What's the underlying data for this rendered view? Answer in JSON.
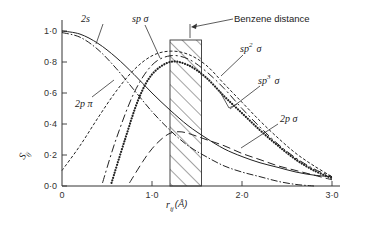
{
  "chart_data": {
    "type": "line",
    "title": "",
    "xlabel": "r_ij (Å)",
    "ylabel": "S_ij",
    "xlim": [
      0,
      3.3
    ],
    "ylim": [
      0,
      1.05
    ],
    "xticks": [
      "0",
      "1·0",
      "2·0",
      "3·0"
    ],
    "xtick_values": [
      0,
      1.0,
      2.0,
      3.0
    ],
    "yticks": [
      "0·0",
      "0·2",
      "0·4",
      "0·6",
      "0·8",
      "1·0"
    ],
    "ytick_values": [
      0,
      0.2,
      0.4,
      0.6,
      0.8,
      1.0
    ],
    "grid": false,
    "annotations": [
      {
        "text": "Benzene distance",
        "region_x": [
          1.2,
          1.55
        ]
      }
    ],
    "series": [
      {
        "name": "2s",
        "style": "solid",
        "x": [
          0,
          0.2,
          0.4,
          0.6,
          0.8,
          1.0,
          1.2,
          1.4,
          1.6,
          1.8,
          2.0,
          2.2,
          2.4,
          2.6,
          2.8,
          3.0
        ],
        "y": [
          1.0,
          0.98,
          0.92,
          0.83,
          0.72,
          0.6,
          0.49,
          0.39,
          0.31,
          0.24,
          0.19,
          0.15,
          0.12,
          0.09,
          0.07,
          0.06
        ]
      },
      {
        "name": "2p π",
        "style": "dashdot",
        "x": [
          0,
          0.2,
          0.4,
          0.6,
          0.8,
          1.0,
          1.2,
          1.4,
          1.6,
          1.8,
          2.0,
          2.2,
          2.4,
          2.6,
          2.8
        ],
        "y": [
          0.99,
          0.96,
          0.88,
          0.76,
          0.62,
          0.48,
          0.36,
          0.26,
          0.19,
          0.13,
          0.09,
          0.06,
          0.03,
          0.01,
          0.0
        ]
      },
      {
        "name": "sp σ",
        "style": "dashed-short",
        "x": [
          0,
          0.2,
          0.4,
          0.6,
          0.8,
          1.0,
          1.2,
          1.4,
          1.6,
          1.8,
          2.0,
          2.2,
          2.4,
          2.6,
          2.8,
          3.0
        ],
        "y": [
          0.1,
          0.26,
          0.44,
          0.61,
          0.75,
          0.84,
          0.87,
          0.85,
          0.78,
          0.66,
          0.54,
          0.42,
          0.31,
          0.21,
          0.13,
          0.06
        ]
      },
      {
        "name": "sp² σ",
        "style": "long-dash-dot",
        "x": [
          0.45,
          0.6,
          0.8,
          1.0,
          1.2,
          1.4,
          1.6,
          1.8,
          2.0,
          2.2,
          2.4,
          2.6,
          2.8,
          3.0
        ],
        "y": [
          0.02,
          0.3,
          0.6,
          0.78,
          0.84,
          0.82,
          0.74,
          0.63,
          0.5,
          0.38,
          0.27,
          0.18,
          0.11,
          0.06
        ]
      },
      {
        "name": "sp³ σ",
        "style": "dotted",
        "x": [
          0.55,
          0.7,
          0.85,
          1.0,
          1.2,
          1.4,
          1.6,
          1.8,
          2.0,
          2.2,
          2.4,
          2.6,
          2.8,
          3.0
        ],
        "y": [
          0.02,
          0.3,
          0.56,
          0.72,
          0.8,
          0.78,
          0.7,
          0.58,
          0.47,
          0.36,
          0.26,
          0.17,
          0.1,
          0.05
        ]
      },
      {
        "name": "2p σ",
        "style": "dashed-long",
        "x": [
          0.75,
          0.9,
          1.0,
          1.1,
          1.2,
          1.3,
          1.4,
          1.6,
          1.8,
          2.0,
          2.2,
          2.4,
          2.6,
          2.8,
          3.0
        ],
        "y": [
          0.02,
          0.16,
          0.24,
          0.3,
          0.34,
          0.35,
          0.34,
          0.3,
          0.26,
          0.21,
          0.17,
          0.13,
          0.1,
          0.07,
          0.04
        ]
      }
    ]
  },
  "labels": {
    "ylabel": "S",
    "ylabel_sub": "ij",
    "xlabel": "r",
    "xlabel_sub": "ij",
    "xlabel_unit": "(Å)",
    "benzene": "Benzene distance",
    "s2": "2s",
    "spsig": "sp σ",
    "sp2": "sp",
    "sp2_sup": "2",
    "sp2_sig": "σ",
    "sp3": "sp",
    "sp3_sup": "3",
    "sp3_sig": "σ",
    "p2pi": "2p π",
    "p2sig": "2p σ"
  }
}
